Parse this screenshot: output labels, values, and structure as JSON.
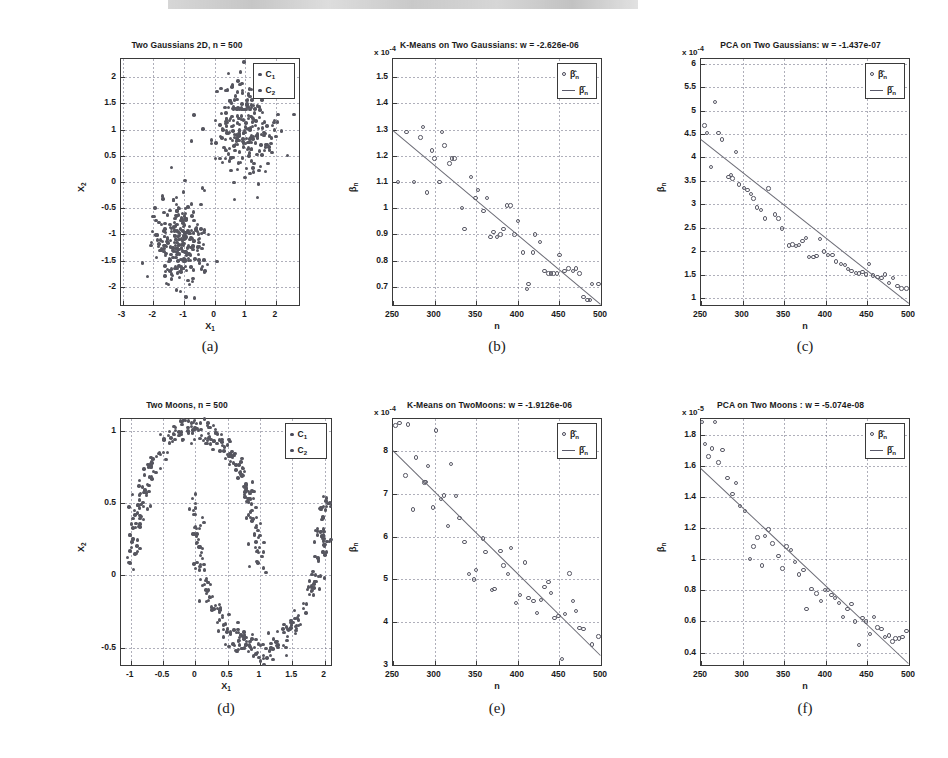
{
  "figure": {
    "running_head": "",
    "captions": [
      "(a)",
      "(b)",
      "(c)",
      "(d)",
      "(e)",
      "(f)"
    ]
  },
  "panels": [
    {
      "key": "a",
      "caption": "(a)",
      "title": "Two Gaussians 2D, n = 500",
      "exponent": "",
      "xlabel": "X",
      "xlabel_sub": "1",
      "ylabel": "X",
      "ylabel_sub": "2",
      "xticks": [
        "-3",
        "-2",
        "-1",
        "0",
        "1",
        "2"
      ],
      "yticks": [
        "-2",
        "-1.5",
        "-1",
        "-0.5",
        "0",
        "0.5",
        "1",
        "1.5",
        "2"
      ],
      "legend": [
        {
          "marker": "dot",
          "label": "C",
          "sub": "1"
        },
        {
          "marker": "dot",
          "label": "C",
          "sub": "2"
        }
      ]
    },
    {
      "key": "b",
      "caption": "(b)",
      "title": "K-Means on Two Gaussians: w = -2.626e-06",
      "exponent_prefix": "x 10",
      "exponent_power": "-4",
      "xlabel": "n",
      "xlabel_sub": "",
      "ylabel": "β",
      "ylabel_sub": "n",
      "xticks": [
        "250",
        "300",
        "350",
        "400",
        "450",
        "500"
      ],
      "yticks": [
        "0.7",
        "0.8",
        "0.9",
        "1",
        "1.1",
        "1.2",
        "1.3",
        "1.4",
        "1.5"
      ],
      "legend": [
        {
          "marker": "circle",
          "label": "β̂",
          "sub": "n"
        },
        {
          "marker": "line",
          "label": "β̄",
          "sub": "n"
        }
      ]
    },
    {
      "key": "c",
      "caption": "(c)",
      "title": "PCA on Two Gaussians: w = -1.437e-07",
      "exponent_prefix": "x 10",
      "exponent_power": "-4",
      "xlabel": "n",
      "xlabel_sub": "",
      "ylabel": "β",
      "ylabel_sub": "n",
      "xticks": [
        "250",
        "300",
        "350",
        "400",
        "450",
        "500"
      ],
      "yticks": [
        "1",
        "1.5",
        "2",
        "2.5",
        "3",
        "3.5",
        "4",
        "4.5",
        "5",
        "5.5",
        "6"
      ],
      "legend": [
        {
          "marker": "circle",
          "label": "β̂",
          "sub": "n"
        },
        {
          "marker": "line",
          "label": "β̄",
          "sub": "n"
        }
      ]
    },
    {
      "key": "d",
      "caption": "(d)",
      "title": "Two Moons, n = 500",
      "exponent": "",
      "xlabel": "X",
      "xlabel_sub": "1",
      "ylabel": "X",
      "ylabel_sub": "2",
      "xticks": [
        "-1",
        "-0.5",
        "0",
        "0.5",
        "1",
        "1.5",
        "2"
      ],
      "yticks": [
        "-0.5",
        "0",
        "0.5",
        "1"
      ],
      "legend": [
        {
          "marker": "dot",
          "label": "C",
          "sub": "1"
        },
        {
          "marker": "dot",
          "label": "C",
          "sub": "2"
        }
      ]
    },
    {
      "key": "e",
      "caption": "(e)",
      "title": "K-Means on TwoMoons: w = -1.9126e-06",
      "exponent_prefix": "x 10",
      "exponent_power": "-4",
      "xlabel": "n",
      "xlabel_sub": "",
      "ylabel": "β",
      "ylabel_sub": "n",
      "xticks": [
        "250",
        "300",
        "350",
        "400",
        "450",
        "500"
      ],
      "yticks": [
        "3",
        "4",
        "5",
        "6",
        "7",
        "8"
      ],
      "legend": [
        {
          "marker": "circle",
          "label": "β̂",
          "sub": "n"
        },
        {
          "marker": "line",
          "label": "β̄",
          "sub": "n"
        }
      ]
    },
    {
      "key": "f",
      "caption": "(f)",
      "title": "PCA on Two Moons : w = -5.074e-08",
      "exponent_prefix": "x 10",
      "exponent_power": "-5",
      "xlabel": "n",
      "xlabel_sub": "",
      "ylabel": "β",
      "ylabel_sub": "n",
      "xticks": [
        "250",
        "300",
        "350",
        "400",
        "450",
        "500"
      ],
      "yticks": [
        "0.4",
        "0.6",
        "0.8",
        "1",
        "1.2",
        "1.4",
        "1.6",
        "1.8"
      ],
      "legend": [
        {
          "marker": "circle",
          "label": "β̂",
          "sub": "n"
        },
        {
          "marker": "line",
          "label": "β̄",
          "sub": "n"
        }
      ]
    }
  ],
  "chart_data": [
    {
      "id": "a",
      "type": "scatter",
      "title": "Two Gaussians 2D, n = 500",
      "xlabel": "X_1",
      "ylabel": "X_2",
      "xlim": [
        -3.05,
        2.75
      ],
      "ylim": [
        -2.35,
        2.35
      ],
      "grid": true,
      "legend_position": "top-right",
      "series": [
        {
          "name": "C_1",
          "color": "#56565f",
          "description": "lower-left Gaussian cluster centered near (-1.1, -1.15), sd ~0.45, 250 points"
        },
        {
          "name": "C_2",
          "color": "#56565f",
          "description": "upper-right Gaussian cluster centered near (1.0, 1.05), sd ~0.5, 250 points"
        }
      ],
      "n": 500
    },
    {
      "id": "b",
      "type": "scatter",
      "title": "K-Means on Two Gaussians: w = -2.626e-06",
      "subtitle": "x 10^-4",
      "xlabel": "n",
      "ylabel": "beta_n",
      "xlim": [
        250,
        500
      ],
      "ylim": [
        0.63,
        1.57
      ],
      "yscale_factor": "1e-4",
      "grid": true,
      "legend_position": "top-right",
      "slope_w": -2.626e-06,
      "series": [
        {
          "name": "beta_n_hat",
          "marker": "open-circle",
          "x": [
            256,
            266,
            275,
            283,
            286,
            291,
            297,
            300,
            306,
            309,
            312,
            318,
            321,
            324,
            333,
            336,
            344,
            349,
            352,
            359,
            363,
            367,
            371,
            375,
            379,
            383,
            387,
            391,
            396,
            400,
            406,
            411,
            413,
            418,
            421,
            427,
            432,
            437,
            440,
            443,
            447,
            450,
            456,
            461,
            466,
            470,
            474,
            479,
            484,
            487,
            489,
            497
          ],
          "y": [
            1.1,
            1.29,
            1.1,
            1.27,
            1.31,
            1.06,
            1.22,
            1.19,
            1.1,
            1.29,
            1.24,
            1.17,
            1.19,
            1.19,
            1.0,
            0.92,
            1.12,
            1.04,
            1.07,
            0.99,
            1.04,
            0.89,
            0.91,
            0.89,
            0.9,
            0.92,
            1.01,
            1.01,
            0.9,
            0.95,
            0.83,
            0.69,
            0.71,
            0.83,
            0.9,
            0.87,
            0.76,
            0.75,
            0.75,
            0.75,
            0.75,
            0.82,
            0.76,
            0.77,
            0.76,
            0.77,
            0.75,
            0.66,
            0.65,
            0.65,
            0.71,
            0.71
          ]
        },
        {
          "name": "beta_n_bar",
          "marker": "line",
          "x": [
            250,
            500
          ],
          "y": [
            1.3,
            0.635
          ]
        }
      ]
    },
    {
      "id": "c",
      "type": "scatter",
      "title": "PCA on Two Gaussians: w = -1.437e-07",
      "subtitle": "x 10^-4",
      "xlabel": "n",
      "ylabel": "beta_n",
      "xlim": [
        250,
        500
      ],
      "ylim": [
        0.85,
        6.1
      ],
      "yscale_factor": "1e-4",
      "grid": true,
      "legend_position": "top-right",
      "slope_w": -1.437e-07,
      "series": [
        {
          "name": "beta_n_hat",
          "marker": "open-circle",
          "x": [
            254,
            257,
            262,
            267,
            271,
            275,
            283,
            286,
            288,
            292,
            296,
            302,
            306,
            310,
            313,
            317,
            322,
            327,
            331,
            339,
            343,
            347,
            356,
            360,
            364,
            368,
            372,
            376,
            380,
            385,
            389,
            393,
            398,
            403,
            408,
            412,
            418,
            423,
            427,
            431,
            436,
            440,
            444,
            448,
            452,
            457,
            462,
            467,
            471,
            476,
            481,
            486,
            491,
            497
          ],
          "y": [
            4.68,
            4.52,
            3.8,
            5.18,
            4.52,
            4.38,
            3.58,
            3.62,
            3.55,
            4.12,
            3.42,
            3.35,
            3.3,
            3.22,
            3.12,
            2.93,
            2.88,
            2.7,
            3.34,
            2.78,
            2.7,
            2.48,
            2.12,
            2.14,
            2.11,
            2.13,
            2.22,
            2.28,
            1.88,
            1.87,
            1.9,
            2.26,
            1.99,
            1.92,
            1.92,
            1.78,
            1.72,
            1.7,
            1.62,
            1.58,
            1.53,
            1.52,
            1.55,
            1.5,
            1.72,
            1.48,
            1.45,
            1.42,
            1.5,
            1.32,
            1.42,
            1.25,
            1.2,
            1.2
          ]
        },
        {
          "name": "beta_n_bar",
          "marker": "line",
          "x": [
            250,
            500
          ],
          "y": [
            4.4,
            0.9
          ]
        }
      ]
    },
    {
      "id": "d",
      "type": "scatter",
      "title": "Two Moons, n = 500",
      "xlabel": "X_1",
      "ylabel": "X_2",
      "xlim": [
        -1.15,
        2.1
      ],
      "ylim": [
        -0.62,
        1.08
      ],
      "grid": true,
      "legend_position": "top-right",
      "series": [
        {
          "name": "C_1",
          "color": "#56565f",
          "description": "upper moon: semicircle radius 1 centered (0,0), upper half, noise 0.05, 250 points"
        },
        {
          "name": "C_2",
          "color": "#56565f",
          "description": "lower moon: semicircle radius 1 centered (1,0.5), lower half, noise 0.05, 250 points"
        }
      ],
      "n": 500
    },
    {
      "id": "e",
      "type": "scatter",
      "title": "K-Means on TwoMoons: w = -1.9126e-06",
      "subtitle": "x 10^-4",
      "xlabel": "n",
      "ylabel": "beta_n",
      "xlim": [
        250,
        500
      ],
      "ylim": [
        3.0,
        8.75
      ],
      "yscale_factor": "1e-4",
      "grid": true,
      "legend_position": "top-right",
      "slope_w": -1.9126e-06,
      "series": [
        {
          "name": "beta_n_hat",
          "marker": "open-circle",
          "x": [
            253,
            258,
            265,
            268,
            274,
            278,
            288,
            289,
            292,
            298,
            302,
            308,
            311,
            316,
            320,
            326,
            330,
            336,
            341,
            347,
            350,
            358,
            361,
            369,
            372,
            379,
            383,
            388,
            392,
            398,
            403,
            409,
            413,
            419,
            423,
            428,
            432,
            437,
            440,
            444,
            449,
            453,
            457,
            462,
            466,
            470,
            474,
            479,
            483,
            487,
            489,
            497
          ],
          "y": [
            8.6,
            8.66,
            7.43,
            8.62,
            6.63,
            7.85,
            7.27,
            7.28,
            7.65,
            6.68,
            8.48,
            6.88,
            6.96,
            6.25,
            7.7,
            6.95,
            6.43,
            5.88,
            5.12,
            5.0,
            5.22,
            5.96,
            5.64,
            4.75,
            4.78,
            5.67,
            5.33,
            5.12,
            5.74,
            4.45,
            4.63,
            5.4,
            4.57,
            4.5,
            4.22,
            4.52,
            4.82,
            4.94,
            4.68,
            4.1,
            4.15,
            3.14,
            4.19,
            5.14,
            4.5,
            4.26,
            3.86,
            3.84,
            2.9,
            2.88,
            3.48,
            3.67
          ]
        },
        {
          "name": "beta_n_bar",
          "marker": "line",
          "x": [
            250,
            500
          ],
          "y": [
            8.02,
            3.22
          ]
        }
      ]
    },
    {
      "id": "f",
      "type": "scatter",
      "title": "PCA on Two Moons : w = -5.074e-08",
      "subtitle": "x 10^-5",
      "xlabel": "n",
      "ylabel": "beta_n",
      "xlim": [
        250,
        500
      ],
      "ylim": [
        0.32,
        1.9
      ],
      "yscale_factor": "1e-5",
      "grid": true,
      "legend_position": "top-right",
      "slope_w": -5.074e-08,
      "series": [
        {
          "name": "beta_n_hat",
          "marker": "open-circle",
          "x": [
            251,
            255,
            259,
            263,
            267,
            271,
            276,
            282,
            288,
            292,
            297,
            303,
            309,
            313,
            318,
            323,
            327,
            331,
            336,
            343,
            348,
            353,
            358,
            363,
            368,
            373,
            377,
            383,
            389,
            394,
            399,
            403,
            407,
            411,
            416,
            421,
            426,
            431,
            435,
            440,
            444,
            448,
            453,
            458,
            462,
            467,
            471,
            476,
            480,
            484,
            488,
            492,
            497
          ],
          "y": [
            1.88,
            1.74,
            1.66,
            1.71,
            1.88,
            1.62,
            1.7,
            1.52,
            1.42,
            1.49,
            1.34,
            1.31,
            1.0,
            1.08,
            1.14,
            0.96,
            1.15,
            1.19,
            1.1,
            1.02,
            0.94,
            1.08,
            1.06,
            0.98,
            0.9,
            0.93,
            0.68,
            0.81,
            0.78,
            0.73,
            0.8,
            0.8,
            0.77,
            0.75,
            0.72,
            0.63,
            0.68,
            0.71,
            0.6,
            0.45,
            0.62,
            0.6,
            0.52,
            0.63,
            0.56,
            0.55,
            0.5,
            0.51,
            0.47,
            0.49,
            0.49,
            0.5,
            0.54
          ]
        },
        {
          "name": "beta_n_bar",
          "marker": "line",
          "x": [
            250,
            500
          ],
          "y": [
            1.585,
            0.33
          ]
        }
      ]
    }
  ]
}
